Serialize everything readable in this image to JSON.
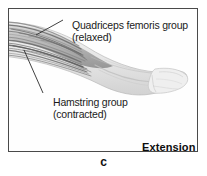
{
  "figure": {
    "caption_letter": "c",
    "panel_label": "Extension",
    "labels": [
      {
        "name": "quadriceps",
        "text": "Quadriceps femoris group\n(relaxed)"
      },
      {
        "name": "hamstring",
        "text": "Hamstring group\n(contracted)"
      }
    ]
  },
  "colors": {
    "frame_border": "#4a4a4a",
    "panel_background": "#fefefe",
    "page_background": "#ffffff",
    "text": "#1b1b1b",
    "muscle_dark": "#6f6f6f",
    "muscle_mid": "#9a9a9a",
    "muscle_light": "#c8c8c8",
    "skin_light": "#ebebeb",
    "leader_line": "#2b2b2b"
  }
}
